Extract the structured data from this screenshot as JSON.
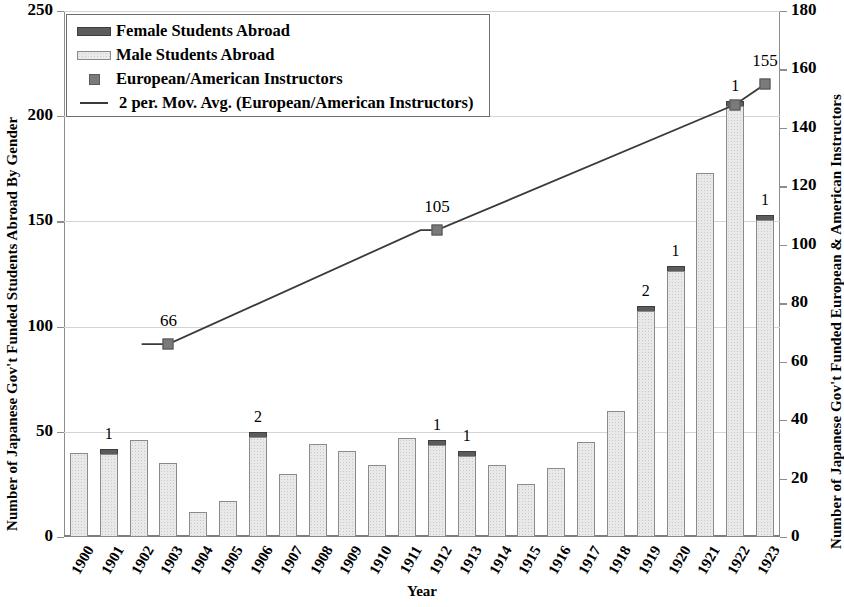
{
  "chart_data": {
    "type": "bar",
    "title": "",
    "xlabel": "Year",
    "ylabel": "Number of Japanese Gov't Funded Students Abroad By Gender",
    "ylabel_secondary": "Number of Japanese Gov't Funded European & American Instructors",
    "ylim": [
      0,
      250
    ],
    "yticks": [
      0,
      50,
      100,
      150,
      200,
      250
    ],
    "ylim_secondary": [
      0,
      180
    ],
    "yticks_secondary": [
      0,
      20,
      40,
      60,
      80,
      100,
      120,
      140,
      160,
      180
    ],
    "grid": true,
    "stacked": true,
    "legend_position": "top-left",
    "categories": [
      "1900",
      "1901",
      "1902",
      "1903",
      "1904",
      "1905",
      "1906",
      "1907",
      "1908",
      "1909",
      "1910",
      "1911",
      "1912",
      "1913",
      "1914",
      "1915",
      "1916",
      "1917",
      "1918",
      "1919",
      "1920",
      "1921",
      "1922",
      "1923"
    ],
    "series": [
      {
        "name": "Male Students Abroad",
        "axis": "left",
        "color": "#e9e9e9",
        "values": [
          40,
          41,
          46,
          35,
          12,
          17,
          48,
          30,
          44,
          41,
          34,
          47,
          45,
          40,
          34,
          25,
          33,
          45,
          60,
          108,
          128,
          173,
          206,
          152
        ]
      },
      {
        "name": "Female Students Abroad",
        "axis": "left",
        "color": "#5c5c5c",
        "values": [
          0,
          1,
          0,
          0,
          0,
          0,
          2,
          0,
          0,
          0,
          0,
          0,
          1,
          1,
          0,
          0,
          0,
          0,
          0,
          2,
          1,
          0,
          1,
          1
        ]
      },
      {
        "name": "European/American Instructors",
        "axis": "right",
        "type": "scatter",
        "color": "#7a7a7a",
        "points": [
          {
            "category": "1903",
            "value": 66
          },
          {
            "category": "1912",
            "value": 105
          },
          {
            "category": "1922",
            "value": 148
          },
          {
            "category": "1923",
            "value": 155
          }
        ]
      },
      {
        "name": "2 per. Mov. Avg. (European/American Instructors)",
        "axis": "right",
        "type": "line",
        "color": "#3a3a3a"
      }
    ],
    "female_bar_labels": [
      {
        "category": "1901",
        "label": "1"
      },
      {
        "category": "1906",
        "label": "2"
      },
      {
        "category": "1912",
        "label": "1"
      },
      {
        "category": "1913",
        "label": "1"
      },
      {
        "category": "1919",
        "label": "2"
      },
      {
        "category": "1920",
        "label": "1"
      },
      {
        "category": "1922",
        "label": "1"
      },
      {
        "category": "1923",
        "label": "1"
      }
    ],
    "point_labels": [
      {
        "category": "1903",
        "label": "66"
      },
      {
        "category": "1912",
        "label": "105"
      },
      {
        "category": "1923",
        "label": "155"
      }
    ]
  },
  "legend": {
    "items": [
      {
        "label": "Female Students Abroad",
        "swatch": "female-swatch"
      },
      {
        "label": "Male Students Abroad",
        "swatch": "male-swatch"
      },
      {
        "label": "European/American Instructors",
        "swatch": "marker-swatch"
      },
      {
        "label": "2 per. Mov. Avg. (European/American Instructors)",
        "swatch": "line-swatch"
      }
    ]
  }
}
